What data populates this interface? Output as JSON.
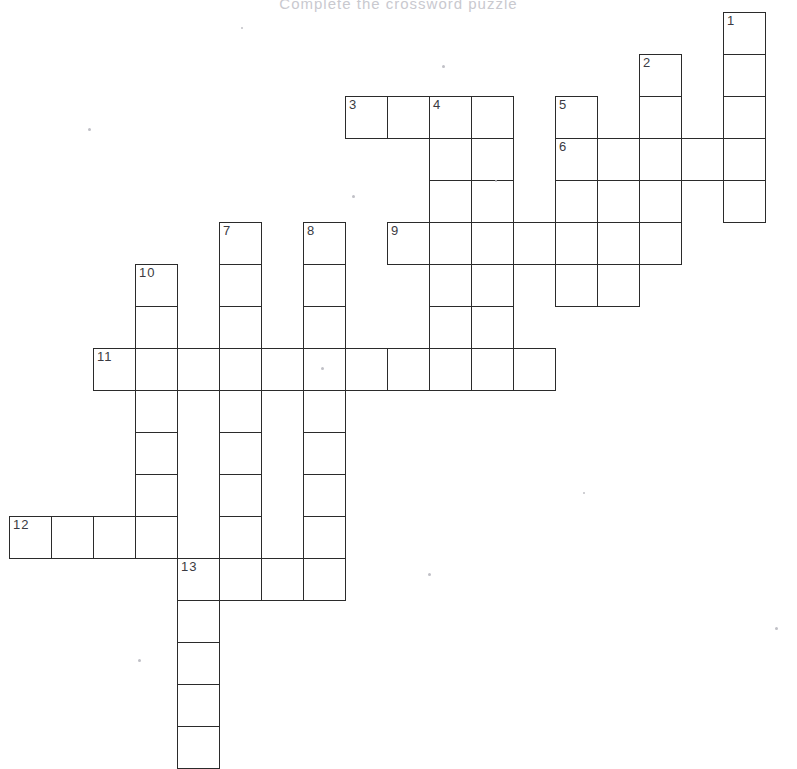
{
  "page": {
    "title": "Complete the crossword puzzle",
    "background_color": "#ffffff",
    "ink_color": "#2b2b2b",
    "number_color": "#3a3a42",
    "width": 797,
    "height": 744
  },
  "grid": {
    "cell_size": 42,
    "origin_x": 9,
    "origin_y": 12,
    "columns": 19,
    "rows": 18,
    "note": "col/row are zero-based indices into the pitch grid"
  },
  "entries": [
    {
      "number": "1",
      "direction": "down",
      "col": 17,
      "row": 0,
      "length": 5
    },
    {
      "number": "2",
      "direction": "down",
      "col": 15,
      "row": 1,
      "length": 5
    },
    {
      "number": "3",
      "direction": "across",
      "col": 8,
      "row": 2,
      "length": 4
    },
    {
      "number": "4",
      "direction": "down",
      "col": 10,
      "row": 2,
      "length": 7
    },
    {
      "number": "5",
      "direction": "down",
      "col": 13,
      "row": 2,
      "length": 5
    },
    {
      "number": "6",
      "direction": "across",
      "col": 13,
      "row": 3,
      "length": 5
    },
    {
      "number": "7",
      "direction": "down",
      "col": 5,
      "row": 5,
      "length": 7
    },
    {
      "number": "8",
      "direction": "down",
      "col": 7,
      "row": 5,
      "length": 9
    },
    {
      "number": "9",
      "direction": "across",
      "col": 9,
      "row": 5,
      "length": 6
    },
    {
      "number": "10",
      "direction": "down",
      "col": 3,
      "row": 6,
      "length": 7
    },
    {
      "number": "11",
      "direction": "across",
      "col": 2,
      "row": 8,
      "length": 11
    },
    {
      "number": "12",
      "direction": "across",
      "col": 0,
      "row": 12,
      "length": 4
    },
    {
      "number": "13",
      "direction": "across",
      "col": 4,
      "row": 13,
      "length": 4
    },
    {
      "number": "13",
      "direction": "down",
      "col": 4,
      "row": 13,
      "length": 5
    }
  ],
  "cells": [
    {
      "col": 17,
      "row": 0,
      "number": "1"
    },
    {
      "col": 17,
      "row": 1,
      "number": ""
    },
    {
      "col": 15,
      "row": 1,
      "number": "2"
    },
    {
      "col": 17,
      "row": 2,
      "number": ""
    },
    {
      "col": 15,
      "row": 2,
      "number": ""
    },
    {
      "col": 13,
      "row": 2,
      "number": "5"
    },
    {
      "col": 8,
      "row": 2,
      "number": "3"
    },
    {
      "col": 9,
      "row": 2,
      "number": ""
    },
    {
      "col": 10,
      "row": 2,
      "number": "4"
    },
    {
      "col": 11,
      "row": 2,
      "number": ""
    },
    {
      "col": 13,
      "row": 3,
      "number": "6"
    },
    {
      "col": 14,
      "row": 3,
      "number": ""
    },
    {
      "col": 15,
      "row": 3,
      "number": ""
    },
    {
      "col": 16,
      "row": 3,
      "number": ""
    },
    {
      "col": 17,
      "row": 3,
      "number": ""
    },
    {
      "col": 10,
      "row": 3,
      "number": ""
    },
    {
      "col": 11,
      "row": 3,
      "number": ""
    },
    {
      "col": 13,
      "row": 4,
      "number": ""
    },
    {
      "col": 14,
      "row": 4,
      "number": ""
    },
    {
      "col": 15,
      "row": 4,
      "number": ""
    },
    {
      "col": 17,
      "row": 4,
      "number": ""
    },
    {
      "col": 10,
      "row": 4,
      "number": ""
    },
    {
      "col": 11,
      "row": 4,
      "number": ""
    },
    {
      "col": 9,
      "row": 5,
      "number": "9"
    },
    {
      "col": 10,
      "row": 5,
      "number": ""
    },
    {
      "col": 11,
      "row": 5,
      "number": ""
    },
    {
      "col": 12,
      "row": 5,
      "number": ""
    },
    {
      "col": 13,
      "row": 5,
      "number": ""
    },
    {
      "col": 14,
      "row": 5,
      "number": ""
    },
    {
      "col": 15,
      "row": 5,
      "number": ""
    },
    {
      "col": 5,
      "row": 5,
      "number": "7"
    },
    {
      "col": 7,
      "row": 5,
      "number": "8"
    },
    {
      "col": 5,
      "row": 6,
      "number": ""
    },
    {
      "col": 7,
      "row": 6,
      "number": ""
    },
    {
      "col": 3,
      "row": 6,
      "number": "10"
    },
    {
      "col": 10,
      "row": 6,
      "number": ""
    },
    {
      "col": 11,
      "row": 6,
      "number": ""
    },
    {
      "col": 13,
      "row": 6,
      "number": ""
    },
    {
      "col": 14,
      "row": 6,
      "number": ""
    },
    {
      "col": 5,
      "row": 7,
      "number": ""
    },
    {
      "col": 7,
      "row": 7,
      "number": ""
    },
    {
      "col": 3,
      "row": 7,
      "number": ""
    },
    {
      "col": 10,
      "row": 7,
      "number": ""
    },
    {
      "col": 11,
      "row": 7,
      "number": ""
    },
    {
      "col": 2,
      "row": 8,
      "number": "11"
    },
    {
      "col": 3,
      "row": 8,
      "number": ""
    },
    {
      "col": 4,
      "row": 8,
      "number": ""
    },
    {
      "col": 5,
      "row": 8,
      "number": ""
    },
    {
      "col": 6,
      "row": 8,
      "number": ""
    },
    {
      "col": 7,
      "row": 8,
      "number": ""
    },
    {
      "col": 8,
      "row": 8,
      "number": ""
    },
    {
      "col": 9,
      "row": 8,
      "number": ""
    },
    {
      "col": 10,
      "row": 8,
      "number": ""
    },
    {
      "col": 11,
      "row": 8,
      "number": ""
    },
    {
      "col": 12,
      "row": 8,
      "number": ""
    },
    {
      "col": 3,
      "row": 9,
      "number": ""
    },
    {
      "col": 5,
      "row": 9,
      "number": ""
    },
    {
      "col": 7,
      "row": 9,
      "number": ""
    },
    {
      "col": 3,
      "row": 10,
      "number": ""
    },
    {
      "col": 5,
      "row": 10,
      "number": ""
    },
    {
      "col": 7,
      "row": 10,
      "number": ""
    },
    {
      "col": 3,
      "row": 11,
      "number": ""
    },
    {
      "col": 5,
      "row": 11,
      "number": ""
    },
    {
      "col": 7,
      "row": 11,
      "number": ""
    },
    {
      "col": 0,
      "row": 12,
      "number": "12"
    },
    {
      "col": 1,
      "row": 12,
      "number": ""
    },
    {
      "col": 2,
      "row": 12,
      "number": ""
    },
    {
      "col": 3,
      "row": 12,
      "number": ""
    },
    {
      "col": 5,
      "row": 12,
      "number": ""
    },
    {
      "col": 7,
      "row": 12,
      "number": ""
    },
    {
      "col": 4,
      "row": 13,
      "number": "13"
    },
    {
      "col": 5,
      "row": 13,
      "number": ""
    },
    {
      "col": 6,
      "row": 13,
      "number": ""
    },
    {
      "col": 7,
      "row": 13,
      "number": ""
    },
    {
      "col": 4,
      "row": 14,
      "number": ""
    },
    {
      "col": 4,
      "row": 15,
      "number": ""
    },
    {
      "col": 4,
      "row": 16,
      "number": ""
    },
    {
      "col": 4,
      "row": 17,
      "number": ""
    }
  ],
  "specks": [
    {
      "x": 442,
      "y": 65,
      "size": 3
    },
    {
      "x": 88,
      "y": 128,
      "size": 3
    },
    {
      "x": 352,
      "y": 195,
      "size": 3
    },
    {
      "x": 495,
      "y": 180,
      "size": 2
    },
    {
      "x": 321,
      "y": 367,
      "size": 3
    },
    {
      "x": 428,
      "y": 573,
      "size": 3
    },
    {
      "x": 138,
      "y": 659,
      "size": 3
    },
    {
      "x": 775,
      "y": 627,
      "size": 3
    },
    {
      "x": 583,
      "y": 492,
      "size": 2
    },
    {
      "x": 241,
      "y": 27,
      "size": 2
    }
  ]
}
